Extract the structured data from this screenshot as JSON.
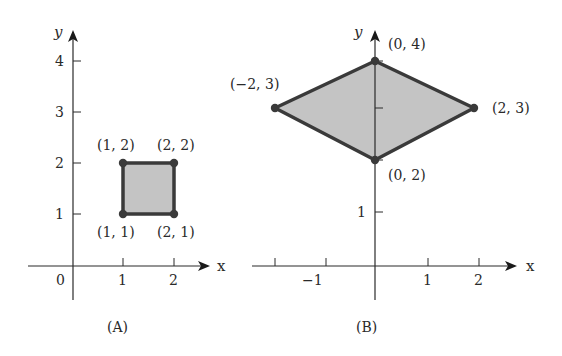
{
  "colors": {
    "shape_fill": "#c4c4c4",
    "shape_stroke": "#3a3a3a",
    "axis": "#2a2a2a",
    "background": "#ffffff"
  },
  "panel_a": {
    "caption": "(A)",
    "x_axis_label": "x",
    "y_axis_label": "y",
    "origin_label": "0",
    "x_ticks": [
      "1",
      "2"
    ],
    "y_ticks": [
      "1",
      "2",
      "3",
      "4"
    ],
    "vertex_labels": [
      "(1, 2)",
      "(2, 2)",
      "(1, 1)",
      "(2, 1)"
    ]
  },
  "panel_b": {
    "caption": "(B)",
    "x_axis_label": "x",
    "y_axis_label": "y",
    "x_ticks": [
      "−1",
      "1",
      "2"
    ],
    "y_ticks": [
      "1"
    ],
    "vertex_labels": [
      "(0, 4)",
      "(−2, 3)",
      "(2, 3)",
      "(0, 2)"
    ]
  }
}
